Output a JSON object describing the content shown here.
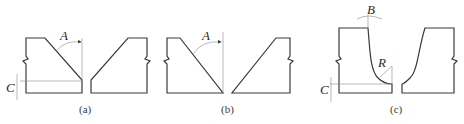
{
  "diagram": {
    "type": "weld joint groove preparations",
    "panels": [
      {
        "caption": "(a)",
        "labels": {
          "angle": "A",
          "root_face": "C"
        },
        "shape": "V-groove with root face"
      },
      {
        "caption": "(b)",
        "labels": {
          "angle": "A"
        },
        "shape": "V-groove without root face"
      },
      {
        "caption": "(c)",
        "labels": {
          "angle": "B",
          "radius": "R",
          "root_face": "C"
        },
        "shape": "U-groove with root radius"
      }
    ]
  }
}
